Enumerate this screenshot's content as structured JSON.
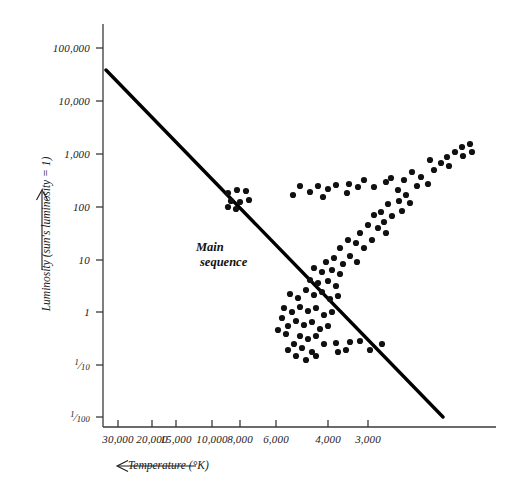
{
  "figure": {
    "background_color": "#ffffff",
    "ink_color": "#1a1a1a"
  },
  "annotations": {
    "main_sequence_line1": "Main",
    "main_sequence_line2": "sequence"
  },
  "axes": {
    "y": {
      "title": "Luminosity (sun's luminosity = 1)",
      "arrow": "→",
      "ticks": [
        {
          "label": "100,000",
          "value": 100000,
          "y": 48
        },
        {
          "label": "10,000",
          "value": 10000,
          "y": 101
        },
        {
          "label": "1,000",
          "value": 1000,
          "y": 154
        },
        {
          "label": "100",
          "value": 100,
          "y": 207
        },
        {
          "label": "10",
          "value": 10,
          "y": 260
        },
        {
          "label": "1",
          "value": 1,
          "y": 312
        },
        {
          "label": "1/10",
          "value": 0.1,
          "y": 365,
          "fraction": {
            "num": "1",
            "den": "10"
          }
        },
        {
          "label": "1/100",
          "value": 0.01,
          "y": 417,
          "fraction": {
            "num": "1",
            "den": "100"
          }
        }
      ]
    },
    "x": {
      "title": "Temperature (°K)",
      "arrow": "←",
      "ticks": [
        {
          "label": "30,000",
          "value": 30000,
          "x": 118
        },
        {
          "label": "20,000",
          "value": 20000,
          "x": 152
        },
        {
          "label": "15,000",
          "value": 15000,
          "x": 176
        },
        {
          "label": "10,000",
          "value": 10000,
          "x": 212
        },
        {
          "label": "8,000",
          "value": 8000,
          "x": 240
        },
        {
          "label": "6,000",
          "value": 6000,
          "x": 276
        },
        {
          "label": "4,000",
          "value": 4000,
          "x": 328
        },
        {
          "label": "3,000",
          "value": 3000,
          "x": 368
        }
      ]
    }
  },
  "chart_data": {
    "type": "scatter",
    "xlabel": "Temperature (°K)",
    "ylabel": "Luminosity (sun's luminosity = 1)",
    "x_scale": "reversed-temperature",
    "y_scale": "log",
    "xlim": [
      33000,
      2500
    ],
    "ylim": [
      0.005,
      300000
    ],
    "grid": false,
    "legend": null,
    "annotations": [
      {
        "text": "Main sequence",
        "x_px": 196,
        "y_px": 240,
        "style": "bold-italic"
      }
    ],
    "series": [
      {
        "name": "Main sequence line",
        "type": "line",
        "stroke_width": 3.4,
        "color": "#000000",
        "points_px": [
          [
            106,
            70
          ],
          [
            443,
            417
          ]
        ]
      },
      {
        "name": "Stars",
        "type": "scatter",
        "marker": "filled-circle",
        "marker_radius_px": 3.1,
        "color": "#111111",
        "points_px": [
          [
            228,
            193
          ],
          [
            237,
            190
          ],
          [
            246,
            191
          ],
          [
            231,
            201
          ],
          [
            240,
            202
          ],
          [
            249,
            200
          ],
          [
            236,
            209
          ],
          [
            228,
            207
          ],
          [
            310,
            192
          ],
          [
            318,
            186
          ],
          [
            328,
            189
          ],
          [
            323,
            197
          ],
          [
            336,
            185
          ],
          [
            349,
            184
          ],
          [
            358,
            187
          ],
          [
            347,
            193
          ],
          [
            364,
            180
          ],
          [
            374,
            187
          ],
          [
            386,
            182
          ],
          [
            398,
            190
          ],
          [
            391,
            178
          ],
          [
            404,
            180
          ],
          [
            406,
            195
          ],
          [
            399,
            201
          ],
          [
            410,
            203
          ],
          [
            402,
            211
          ],
          [
            412,
            172
          ],
          [
            421,
            177
          ],
          [
            417,
            186
          ],
          [
            428,
            184
          ],
          [
            434,
            170
          ],
          [
            441,
            163
          ],
          [
            430,
            160
          ],
          [
            447,
            157
          ],
          [
            455,
            152
          ],
          [
            449,
            166
          ],
          [
            462,
            147
          ],
          [
            470,
            144
          ],
          [
            463,
            156
          ],
          [
            472,
            152
          ],
          [
            300,
            186
          ],
          [
            293,
            195
          ],
          [
            388,
            204
          ],
          [
            381,
            212
          ],
          [
            392,
            216
          ],
          [
            384,
            222
          ],
          [
            374,
            215
          ],
          [
            378,
            228
          ],
          [
            386,
            233
          ],
          [
            368,
            225
          ],
          [
            360,
            233
          ],
          [
            372,
            240
          ],
          [
            356,
            243
          ],
          [
            364,
            248
          ],
          [
            348,
            240
          ],
          [
            340,
            248
          ],
          [
            350,
            256
          ],
          [
            357,
            262
          ],
          [
            334,
            258
          ],
          [
            343,
            264
          ],
          [
            326,
            262
          ],
          [
            332,
            270
          ],
          [
            340,
            274
          ],
          [
            322,
            272
          ],
          [
            314,
            268
          ],
          [
            328,
            281
          ],
          [
            336,
            286
          ],
          [
            318,
            283
          ],
          [
            310,
            280
          ],
          [
            306,
            290
          ],
          [
            314,
            295
          ],
          [
            322,
            292
          ],
          [
            330,
            299
          ],
          [
            338,
            296
          ],
          [
            298,
            298
          ],
          [
            290,
            294
          ],
          [
            300,
            307
          ],
          [
            308,
            311
          ],
          [
            316,
            308
          ],
          [
            324,
            315
          ],
          [
            332,
            312
          ],
          [
            292,
            312
          ],
          [
            284,
            308
          ],
          [
            296,
            321
          ],
          [
            304,
            325
          ],
          [
            312,
            322
          ],
          [
            320,
            329
          ],
          [
            328,
            326
          ],
          [
            288,
            326
          ],
          [
            282,
            318
          ],
          [
            300,
            336
          ],
          [
            308,
            339
          ],
          [
            316,
            336
          ],
          [
            294,
            344
          ],
          [
            302,
            348
          ],
          [
            312,
            352
          ],
          [
            324,
            344
          ],
          [
            336,
            343
          ],
          [
            350,
            342
          ],
          [
            360,
            341
          ],
          [
            286,
            334
          ],
          [
            278,
            330
          ],
          [
            370,
            350
          ],
          [
            382,
            344
          ],
          [
            306,
            360
          ],
          [
            316,
            356
          ],
          [
            296,
            356
          ],
          [
            288,
            350
          ],
          [
            338,
            352
          ],
          [
            346,
            350
          ]
        ]
      }
    ]
  }
}
